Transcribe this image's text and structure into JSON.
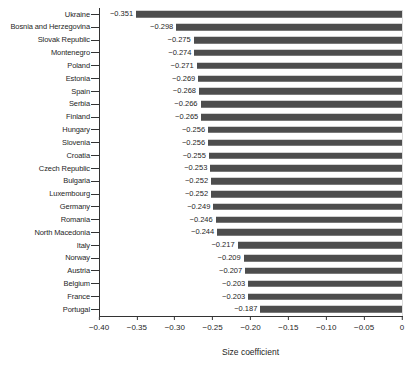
{
  "chart_data": {
    "type": "bar",
    "orientation": "horizontal",
    "title": "",
    "xlabel": "Size coefficient",
    "ylabel": "",
    "xlim": [
      -0.4,
      0
    ],
    "xticks": [
      -0.4,
      -0.35,
      -0.3,
      -0.25,
      -0.2,
      -0.15,
      -0.1,
      -0.05,
      0
    ],
    "xtick_labels": [
      "−0.40",
      "−0.35",
      "−0.30",
      "−0.25",
      "−0.20",
      "−0.15",
      "−0.10",
      "−0.05",
      "0"
    ],
    "grid": false,
    "legend": false,
    "bar_color": "#4d4d4d",
    "categories": [
      "Ukraine",
      "Bosnia and Herzegovina",
      "Slovak Republic",
      "Montenegro",
      "Poland",
      "Estonia",
      "Spain",
      "Serbia",
      "Finland",
      "Hungary",
      "Slovenia",
      "Croatia",
      "Czech Republic",
      "Bulgaria",
      "Luxembourg",
      "Germany",
      "Romania",
      "North Macedonia",
      "Italy",
      "Norway",
      "Austria",
      "Belgium",
      "France",
      "Portugal"
    ],
    "values": [
      -0.351,
      -0.298,
      -0.275,
      -0.274,
      -0.271,
      -0.269,
      -0.268,
      -0.266,
      -0.265,
      -0.256,
      -0.256,
      -0.255,
      -0.253,
      -0.252,
      -0.252,
      -0.249,
      -0.246,
      -0.244,
      -0.217,
      -0.209,
      -0.207,
      -0.203,
      -0.203,
      -0.187
    ],
    "value_labels": [
      "−0.351",
      "−0.298",
      "−0.275",
      "−0.274",
      "−0.271",
      "−0.269",
      "−0.268",
      "−0.266",
      "−0.265",
      "−0.256",
      "−0.256",
      "−0.255",
      "−0.253",
      "−0.252",
      "−0.252",
      "−0.249",
      "−0.246",
      "−0.244",
      "−0.217",
      "−0.209",
      "−0.207",
      "−0.203",
      "−0.203",
      "−0.187"
    ]
  }
}
